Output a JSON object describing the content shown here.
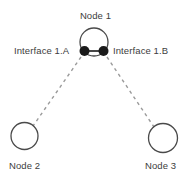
{
  "diagram": {
    "type": "network-topology",
    "background_color": "#ffffff",
    "stroke_color": "#4a4a4a",
    "dash_color": "#9a9a9a",
    "dot_color": "#1a1a1a",
    "text_color": "#3d3d3d",
    "width": 191,
    "height": 183,
    "nodes": [
      {
        "id": "node-1",
        "label": "Node 1",
        "shape": "circle",
        "filled": false,
        "cx": 94,
        "cy": 42,
        "r": 14
      },
      {
        "id": "node-2",
        "label": "Node 2",
        "shape": "circle",
        "filled": false,
        "cx": 24.5,
        "cy": 136,
        "r": 13.5
      },
      {
        "id": "node-3",
        "label": "Node 3",
        "shape": "circle",
        "filled": false,
        "cx": 163,
        "cy": 138,
        "r": 14.5
      }
    ],
    "interfaces": [
      {
        "id": "interface-1a",
        "label": "Interface 1.A",
        "cx": 84.5,
        "cy": 51,
        "r": 5,
        "filled": true,
        "parent": "node-1"
      },
      {
        "id": "interface-1b",
        "label": "Interface 1.B",
        "cx": 103.5,
        "cy": 51,
        "r": 5,
        "filled": true,
        "parent": "node-1"
      }
    ],
    "links": [
      {
        "id": "link-1a-to-node2",
        "style": "dashed",
        "from": "interface-1a",
        "to": "node-2",
        "x1": 81,
        "y1": 57,
        "x2": 33,
        "y2": 126
      },
      {
        "id": "link-1b-to-node3",
        "style": "dashed",
        "from": "interface-1b",
        "to": "node-3",
        "x1": 107,
        "y1": 57,
        "x2": 154,
        "y2": 127
      }
    ],
    "connector": {
      "id": "interface-connector",
      "x1": 85,
      "y1": 51,
      "x2": 103,
      "y2": 51
    }
  }
}
